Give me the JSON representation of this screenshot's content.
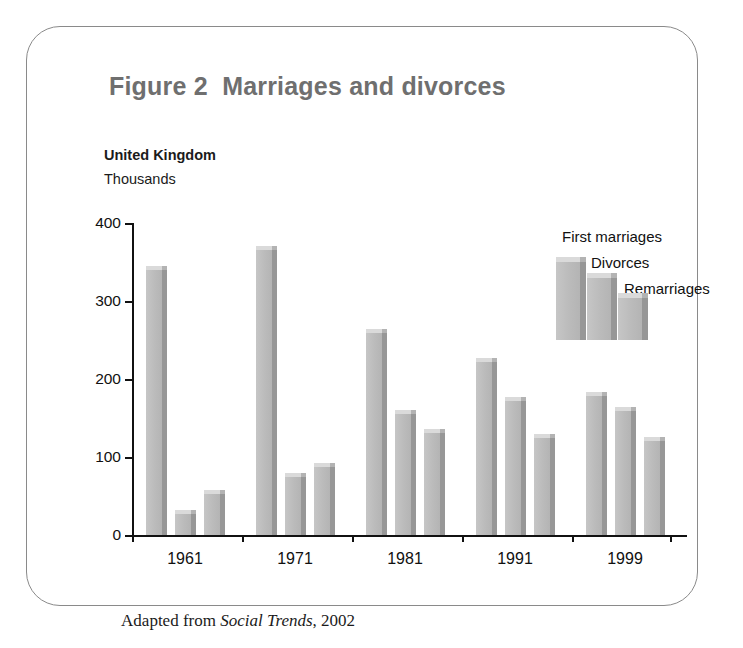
{
  "figure": {
    "title": "Figure 2  Marriages and divorces",
    "region": "United Kingdom",
    "units": "Thousands",
    "source_note_prefix": "Adapted from ",
    "source_note_italic": "Social Trends",
    "source_note_suffix": ", 2002"
  },
  "chart_data": {
    "type": "bar",
    "title": "Figure 2  Marriages and divorces",
    "subtitle": "United Kingdom",
    "xlabel": "",
    "ylabel": "Thousands",
    "ylim": [
      0,
      400
    ],
    "yticks": [
      0,
      100,
      200,
      300,
      400
    ],
    "ytick_labels": [
      "0",
      "100",
      "200",
      "300",
      "400"
    ],
    "grid": false,
    "legend_position": "top-right",
    "categories": [
      "1961",
      "1971",
      "1981",
      "1991",
      "1999"
    ],
    "series": [
      {
        "name": "First marriages",
        "values": [
          340,
          365,
          259,
          222,
          178
        ]
      },
      {
        "name": "Divorces",
        "values": [
          27,
          75,
          155,
          172,
          159
        ]
      },
      {
        "name": "Remarriages",
        "values": [
          52,
          87,
          131,
          125,
          120
        ]
      }
    ],
    "annotations": [
      "Adapted from Social Trends, 2002"
    ],
    "colors": {
      "bar_face": "#bdbdbd",
      "bar_side": "#979797",
      "bar_top": "#dadada",
      "axis": "#111111",
      "title_text": "#6f6f6f",
      "body_text": "#111111",
      "frame_border": "#8a8a8a"
    }
  }
}
